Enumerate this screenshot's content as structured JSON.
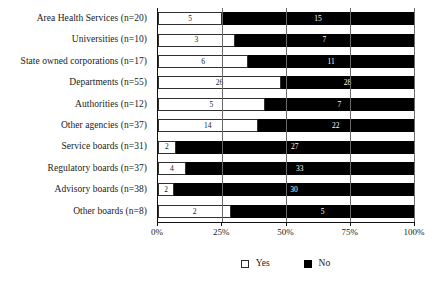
{
  "chart_data": {
    "type": "bar",
    "orientation": "horizontal",
    "stacked": true,
    "normalized_percent": true,
    "title": "",
    "subtitle": "",
    "xlabel": "",
    "ylabel": "",
    "xlim": [
      0,
      100
    ],
    "grid": true,
    "legend_position": "bottom-center",
    "xtick_labels": [
      "0%",
      "25%",
      "50%",
      "75%",
      "100%"
    ],
    "xtick_values": [
      0,
      25,
      50,
      75,
      100
    ],
    "categories": [
      "Area Health Services (n=20)",
      "Universities (n=10)",
      "State owned corporations (n=17)",
      "Departments (n=55)",
      "Authorities (n=12)",
      "Other agencies (n=37)",
      "Service boards (n=31)",
      "Regulatory boards (n=37)",
      "Advisory boards (n=38)",
      "Other boards (n=8)"
    ],
    "series": [
      {
        "name": "Yes",
        "color": "#ffffff",
        "values": [
          5,
          3,
          6,
          26,
          5,
          14,
          2,
          4,
          2,
          2
        ],
        "percents": [
          25.0,
          30.0,
          35.3,
          48.1,
          41.7,
          38.9,
          6.9,
          10.8,
          6.3,
          28.6
        ]
      },
      {
        "name": "No",
        "color": "#000000",
        "values": [
          15,
          7,
          11,
          28,
          7,
          22,
          27,
          33,
          30,
          5
        ],
        "percents": [
          75.0,
          70.0,
          64.7,
          51.9,
          58.3,
          61.1,
          93.1,
          89.2,
          93.8,
          71.4
        ]
      }
    ],
    "legend": [
      {
        "label": "Yes",
        "swatch": "white-square-outline"
      },
      {
        "label": "No",
        "swatch": "black-square-filled"
      }
    ]
  }
}
